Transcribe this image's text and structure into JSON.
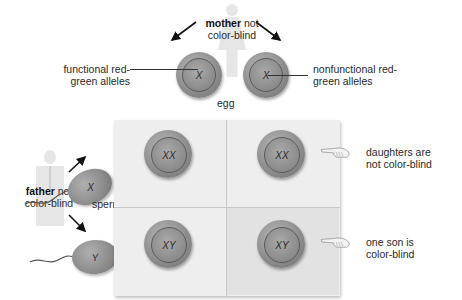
{
  "mother": {
    "bold": "mother",
    "rest": " not",
    "line2": "color-blind"
  },
  "father": {
    "bold": "father",
    "rest": " not",
    "line2": "color-blind"
  },
  "eggs": [
    {
      "allele": "X",
      "label_line1": "functional red-",
      "label_line2": "green alleles"
    },
    {
      "allele": "X",
      "label_line1": "nonfunctional red-",
      "label_line2": "green alleles"
    }
  ],
  "egg_label": "egg",
  "sperm_label": "sperm",
  "sperm": [
    {
      "allele": "X"
    },
    {
      "allele": "Y"
    }
  ],
  "grid": {
    "cells": [
      {
        "genotype": "XX"
      },
      {
        "genotype": "XX"
      },
      {
        "genotype": "XY"
      },
      {
        "genotype": "XY"
      }
    ]
  },
  "notes": [
    {
      "line1": "daughters are",
      "line2": "not color-blind"
    },
    {
      "line1": "one son is",
      "line2": "color-blind"
    }
  ],
  "colors": {
    "cell": "#8e8e8e",
    "grid_bg": "#eeeeee",
    "shade": "#e2e2e2",
    "text": "#2a2a2a"
  }
}
